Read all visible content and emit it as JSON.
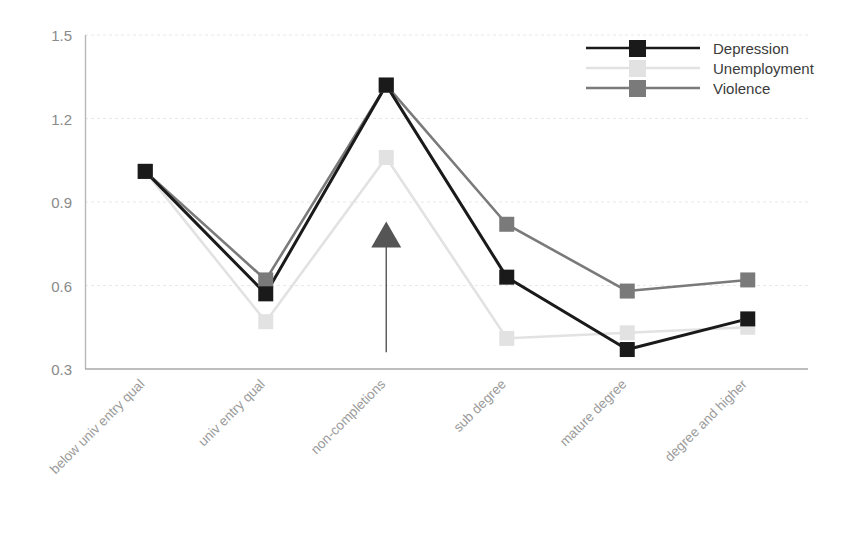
{
  "chart_data": {
    "type": "line",
    "title": "",
    "subtitle": "",
    "xlabel": "",
    "ylabel": "",
    "categories": [
      "below univ entry qual",
      "univ entry qual",
      "non-completions",
      "sub degree",
      "mature degree",
      "degree and higher"
    ],
    "yticks": [
      "0.3",
      "0.6",
      "0.9",
      "1.2",
      "1.5"
    ],
    "ytick_values": [
      0.3,
      0.6,
      0.9,
      1.2,
      1.5
    ],
    "ylim": [
      0.3,
      1.5
    ],
    "grid": true,
    "grid_axis": "y",
    "legend_position": "top-right",
    "series": [
      {
        "name": "Depression",
        "color": "#1a1a1a",
        "marker": "square",
        "values": [
          1.01,
          0.57,
          1.32,
          0.63,
          0.37,
          0.48
        ]
      },
      {
        "name": "Unemployment",
        "color": "#e2e2e2",
        "marker": "square",
        "values": [
          1.01,
          0.47,
          1.06,
          0.41,
          0.43,
          0.45
        ]
      },
      {
        "name": "Violence",
        "color": "#7a7a7a",
        "marker": "square",
        "values": [
          1.01,
          0.62,
          1.32,
          0.82,
          0.58,
          0.62
        ]
      }
    ],
    "annotations": [
      {
        "type": "arrow",
        "name": "upward-arrow-annotation",
        "category": "non-completions",
        "direction": "up",
        "tail_value": 0.36,
        "head_value": 0.83,
        "color": "#555555",
        "label": ""
      }
    ]
  },
  "legend": {
    "items": [
      {
        "label": "Depression",
        "color": "#1a1a1a"
      },
      {
        "label": "Unemployment",
        "color": "#e2e2e2"
      },
      {
        "label": "Violence",
        "color": "#7a7a7a"
      }
    ]
  },
  "axes": {
    "y_axis_color": "#b8b8b8",
    "x_axis_color": "#a8a8a8",
    "gridline_color": "#e8e8e8"
  }
}
